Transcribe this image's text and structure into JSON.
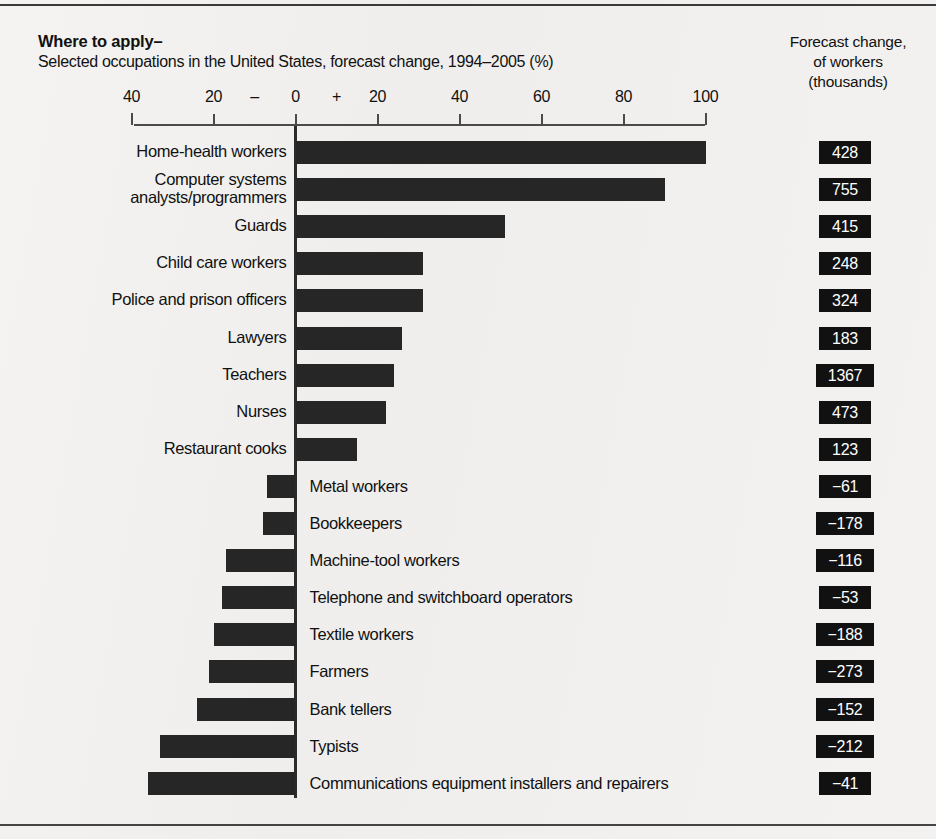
{
  "header": {
    "title": "Where to apply–",
    "subtitle": "Selected occupations in the United States, forecast change, 1994–2005 (%)",
    "right_caption_line1": "Forecast change,",
    "right_caption_line2": "of workers",
    "right_caption_line3": "(thousands)"
  },
  "chart_data": {
    "type": "bar",
    "orientation": "horizontal",
    "title": "Where to apply–",
    "subtitle": "Selected occupations in the United States, forecast change, 1994–2005 (%)",
    "xlabel": "",
    "ylabel": "",
    "xlim": [
      -40,
      100
    ],
    "grid": false,
    "legend": null,
    "tick_labels": [
      "40",
      "20",
      "–",
      "0",
      "+",
      "20",
      "40",
      "60",
      "80",
      "100"
    ],
    "tick_values": [
      -40,
      -20,
      -10,
      0,
      10,
      20,
      40,
      60,
      80,
      100
    ],
    "axis_ticks": [
      -40,
      -20,
      0,
      20,
      40,
      60,
      80,
      100
    ],
    "value_column_header": "Forecast change, of workers (thousands)",
    "categories": [
      "Home-health workers",
      "Computer systems analysts/programmers",
      "Guards",
      "Child care workers",
      "Police and prison officers",
      "Lawyers",
      "Teachers",
      "Nurses",
      "Restaurant cooks",
      "Metal workers",
      "Bookkeepers",
      "Machine-tool workers",
      "Telephone and switchboard operators",
      "Textile workers",
      "Farmers",
      "Bank tellers",
      "Typists",
      "Communications equipment installers and repairers"
    ],
    "values": [
      100,
      90,
      51,
      31,
      31,
      26,
      24,
      22,
      15,
      -7,
      -8,
      -17,
      -18,
      -20,
      -21,
      -24,
      -33,
      -36
    ],
    "workers_thousands": [
      428,
      755,
      415,
      248,
      324,
      183,
      1367,
      473,
      123,
      -61,
      -178,
      -116,
      -53,
      -188,
      -273,
      -152,
      -212,
      -41
    ],
    "workers_labels": [
      "428",
      "755",
      "415",
      "248",
      "324",
      "183",
      "1367",
      "473",
      "123",
      "−61",
      "−178",
      "−116",
      "−53",
      "−188",
      "−273",
      "−152",
      "−212",
      "−41"
    ]
  },
  "rows": [
    {
      "label": "Home-health workers",
      "label2": "",
      "pct": 100,
      "val": "428",
      "side": "left"
    },
    {
      "label": "Computer systems",
      "label2": "analysts/programmers",
      "pct": 90,
      "val": "755",
      "side": "left"
    },
    {
      "label": "Guards",
      "label2": "",
      "pct": 51,
      "val": "415",
      "side": "left"
    },
    {
      "label": "Child care workers",
      "label2": "",
      "pct": 31,
      "val": "248",
      "side": "left"
    },
    {
      "label": "Police and prison officers",
      "label2": "",
      "pct": 31,
      "val": "324",
      "side": "left"
    },
    {
      "label": "Lawyers",
      "label2": "",
      "pct": 26,
      "val": "183",
      "side": "left"
    },
    {
      "label": "Teachers",
      "label2": "",
      "pct": 24,
      "val": "1367",
      "side": "left"
    },
    {
      "label": "Nurses",
      "label2": "",
      "pct": 22,
      "val": "473",
      "side": "left"
    },
    {
      "label": "Restaurant cooks",
      "label2": "",
      "pct": 15,
      "val": "123",
      "side": "left"
    },
    {
      "label": "Metal workers",
      "label2": "",
      "pct": -7,
      "val": "−61",
      "side": "right"
    },
    {
      "label": "Bookkeepers",
      "label2": "",
      "pct": -8,
      "val": "−178",
      "side": "right"
    },
    {
      "label": "Machine-tool workers",
      "label2": "",
      "pct": -17,
      "val": "−116",
      "side": "right"
    },
    {
      "label": "Telephone and switchboard operators",
      "label2": "",
      "pct": -18,
      "val": "−53",
      "side": "right"
    },
    {
      "label": "Textile workers",
      "label2": "",
      "pct": -20,
      "val": "−188",
      "side": "right"
    },
    {
      "label": "Farmers",
      "label2": "",
      "pct": -21,
      "val": "−273",
      "side": "right"
    },
    {
      "label": "Bank tellers",
      "label2": "",
      "pct": -24,
      "val": "−152",
      "side": "right"
    },
    {
      "label": "Typists",
      "label2": "",
      "pct": -33,
      "val": "−212",
      "side": "right"
    },
    {
      "label": "Communications equipment installers and repairers",
      "label2": "",
      "pct": -36,
      "val": "−41",
      "side": "right"
    }
  ],
  "axis": {
    "labels": [
      {
        "text": "40",
        "v": -40
      },
      {
        "text": "20",
        "v": -20
      },
      {
        "text": "–",
        "v": -10
      },
      {
        "text": "0",
        "v": 0
      },
      {
        "text": "+",
        "v": 10
      },
      {
        "text": "20",
        "v": 20
      },
      {
        "text": "40",
        "v": 40
      },
      {
        "text": "60",
        "v": 60
      },
      {
        "text": "80",
        "v": 80
      },
      {
        "text": "100",
        "v": 100
      }
    ],
    "ticks": [
      -40,
      -20,
      0,
      20,
      40,
      60,
      80,
      100
    ]
  },
  "colors": {
    "bar": "#262626",
    "value_box_bg": "#111111",
    "value_box_text": "#ffffff",
    "background": "#f2f1ef",
    "axis": "#4a4a4a"
  }
}
